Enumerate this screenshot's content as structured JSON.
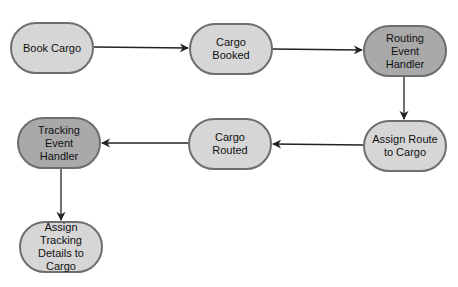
{
  "diagram": {
    "type": "flowchart",
    "colors": {
      "node_fill": "#d6d6d6",
      "handler_fill": "#a9a9a9",
      "border": "#6e6e6e",
      "edge": "#222222",
      "background": "#ffffff"
    },
    "nodes": [
      {
        "id": "book_cargo",
        "label": "Book Cargo",
        "style": "light",
        "x": 10,
        "y": 22,
        "w": 84,
        "h": 52
      },
      {
        "id": "cargo_booked",
        "label": "Cargo Booked",
        "style": "light",
        "x": 189,
        "y": 23,
        "w": 84,
        "h": 52
      },
      {
        "id": "routing_event_handler",
        "label": "Routing Event Handler",
        "style": "dark",
        "x": 363,
        "y": 25,
        "w": 84,
        "h": 52
      },
      {
        "id": "assign_route_to_cargo",
        "label": "Assign Route to Cargo",
        "style": "light",
        "x": 363,
        "y": 120,
        "w": 84,
        "h": 52
      },
      {
        "id": "cargo_routed",
        "label": "Cargo Routed",
        "style": "light",
        "x": 188,
        "y": 118,
        "w": 84,
        "h": 52
      },
      {
        "id": "tracking_event_handler",
        "label": "Tracking Event Handler",
        "style": "dark",
        "x": 17,
        "y": 117,
        "w": 84,
        "h": 52
      },
      {
        "id": "assign_tracking_details",
        "label": "Assign Tracking Details to Cargo",
        "style": "light",
        "x": 19,
        "y": 221,
        "w": 84,
        "h": 52
      }
    ],
    "edges": [
      {
        "from": "book_cargo",
        "to": "cargo_booked"
      },
      {
        "from": "cargo_booked",
        "to": "routing_event_handler"
      },
      {
        "from": "routing_event_handler",
        "to": "assign_route_to_cargo"
      },
      {
        "from": "assign_route_to_cargo",
        "to": "cargo_routed"
      },
      {
        "from": "cargo_routed",
        "to": "tracking_event_handler"
      },
      {
        "from": "tracking_event_handler",
        "to": "assign_tracking_details"
      }
    ]
  }
}
